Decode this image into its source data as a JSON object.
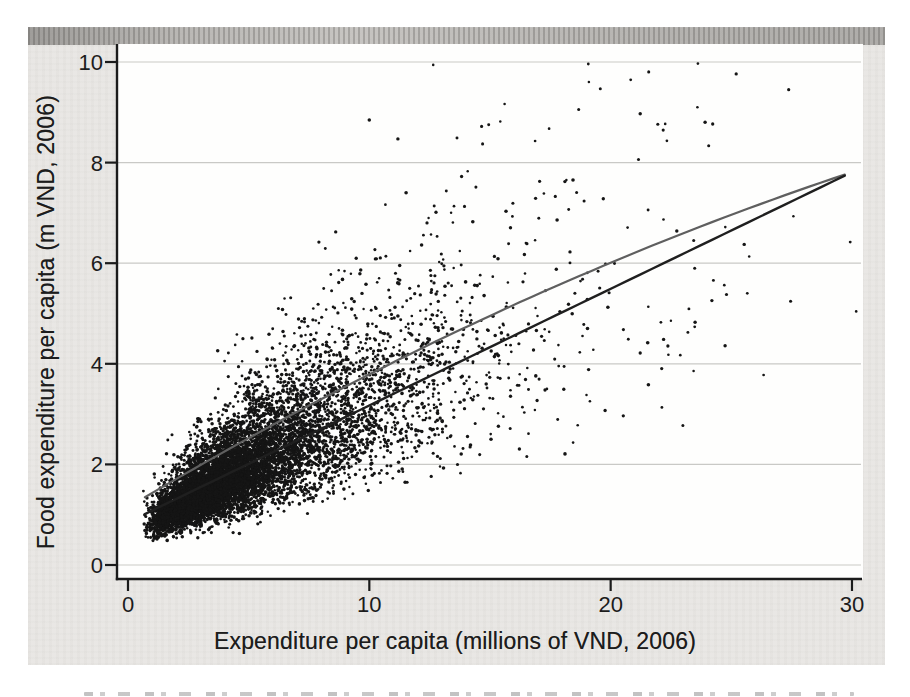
{
  "figure": {
    "kind": "scanned scatterplot figure",
    "background_color": "#e9e7e4",
    "plot_background": "#fefefd",
    "axis_color": "#1b1b1b",
    "gridline_color": "#c9c9c6",
    "tick_label_color": "#1c1c1c"
  },
  "chart_data": {
    "type": "scatter",
    "title": "",
    "xlabel": "Expenditure per capita (millions of VND, 2006)",
    "ylabel": "Food expenditure per capita (m VND, 2006)",
    "xticks": [
      0,
      10,
      20,
      30
    ],
    "yticks": [
      0,
      2,
      4,
      6,
      8,
      10
    ],
    "xlim": [
      -0.5,
      30.6
    ],
    "ylim": [
      -0.28,
      10.35
    ],
    "grid": "horizontal-only",
    "legend": "none",
    "n_points": 8600,
    "point_color": "#151515",
    "point_radius_px": 1.35,
    "seed": 2006,
    "x_distribution": {
      "type": "lognormal",
      "mu_log": 1.5,
      "sigma_log": 0.6,
      "min": 0.62,
      "max": 30.2
    },
    "y_model": {
      "type": "engel-curve",
      "intercept": 0.62,
      "slope": 0.28,
      "quad": -0.002,
      "noise": "lognormal",
      "noise_sigma_base": 0.24,
      "noise_sigma_per_x": 0.006,
      "y_min": 0.33,
      "y_max": 9.97
    },
    "fit_lines": [
      {
        "name": "quadratic-fit",
        "color": "#5f5f5f",
        "width_px": 2.2,
        "intercept": 1.15,
        "slope": 0.285,
        "quad": -0.0021,
        "x_start": 0.7,
        "x_end": 30
      },
      {
        "name": "linear-fit",
        "color": "#1f1f1f",
        "width_px": 2.4,
        "intercept": 0.85,
        "slope": 0.232,
        "quad": 0,
        "x_start": 0.7,
        "x_end": 30
      }
    ]
  }
}
